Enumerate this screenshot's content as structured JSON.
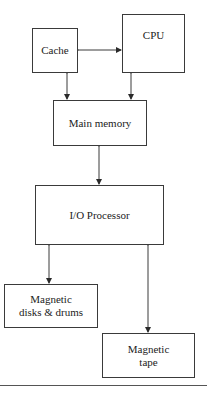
{
  "diagram": {
    "nodes": {
      "cache": {
        "label": "Cache"
      },
      "cpu": {
        "label": "CPU"
      },
      "main_memory": {
        "label": "Main memory"
      },
      "io_processor": {
        "label": "I/O Processor"
      },
      "magnetic_disks": {
        "label": "Magnetic\ndisks & drums"
      },
      "magnetic_tape": {
        "label": "Magnetic\ntape"
      }
    },
    "edges": [
      {
        "from": "cache",
        "to": "cpu",
        "type": "bidirectional"
      },
      {
        "from": "cache",
        "to": "main_memory",
        "type": "bidirectional"
      },
      {
        "from": "cpu",
        "to": "main_memory",
        "type": "bidirectional"
      },
      {
        "from": "main_memory",
        "to": "io_processor",
        "type": "bidirectional"
      },
      {
        "from": "io_processor",
        "to": "magnetic_disks",
        "type": "bidirectional"
      },
      {
        "from": "io_processor",
        "to": "magnetic_tape",
        "type": "bidirectional"
      }
    ],
    "colors": {
      "stroke": "#3a3a3a",
      "text": "#222222",
      "background": "#ffffff"
    }
  }
}
